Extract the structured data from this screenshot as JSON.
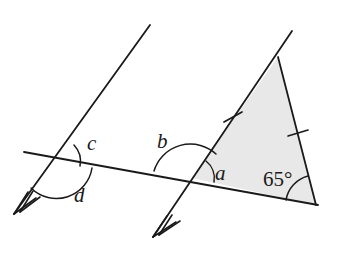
{
  "figure": {
    "background_color": "#ffffff",
    "stroke_color": "#1a1a1a",
    "triangle_fill_color": "#e8e8e8"
  },
  "labels": {
    "angle_a": "a",
    "angle_b": "b",
    "angle_c": "c",
    "angle_d": "d",
    "angle_known": "65°"
  },
  "geometry": {
    "transversal": {
      "x1": 24,
      "y1": 152,
      "x2": 318,
      "y2": 205
    },
    "parallel_line_left": {
      "x1": 150,
      "y1": 25,
      "x2": 14,
      "y2": 214,
      "arrow_marks": 2
    },
    "parallel_line_right": {
      "x1": 292,
      "y1": 31,
      "x2": 153,
      "y2": 237,
      "arrow_marks": 2
    },
    "intersection_left": {
      "x": 57,
      "y": 162
    },
    "intersection_right": {
      "x": 192,
      "y": 178
    },
    "triangle_vertices": [
      {
        "name": "apex",
        "x": 278,
        "y": 57
      },
      {
        "name": "left-base",
        "x": 192,
        "y": 178
      },
      {
        "name": "right-base",
        "x": 316,
        "y": 205
      }
    ],
    "tick_marks": [
      {
        "name": "tick-left-side",
        "x": 233,
        "y": 117
      },
      {
        "name": "tick-right-side",
        "x": 298,
        "y": 133
      }
    ],
    "arcs": [
      {
        "name": "arc-c",
        "cx": 57,
        "cy": 162,
        "r": 24
      },
      {
        "name": "arc-d",
        "cx": 57,
        "cy": 162,
        "r": 36
      },
      {
        "name": "arc-b",
        "cx": 192,
        "cy": 178,
        "r": 38
      },
      {
        "name": "arc-a",
        "cx": 192,
        "cy": 178,
        "r": 22
      },
      {
        "name": "arc-65",
        "cx": 316,
        "cy": 205,
        "r": 30
      }
    ]
  },
  "label_positions": {
    "a": {
      "x": 215,
      "y": 180
    },
    "b": {
      "x": 157,
      "y": 148
    },
    "c": {
      "x": 87,
      "y": 150
    },
    "d": {
      "x": 74,
      "y": 202
    },
    "deg65": {
      "x": 263,
      "y": 186
    }
  }
}
